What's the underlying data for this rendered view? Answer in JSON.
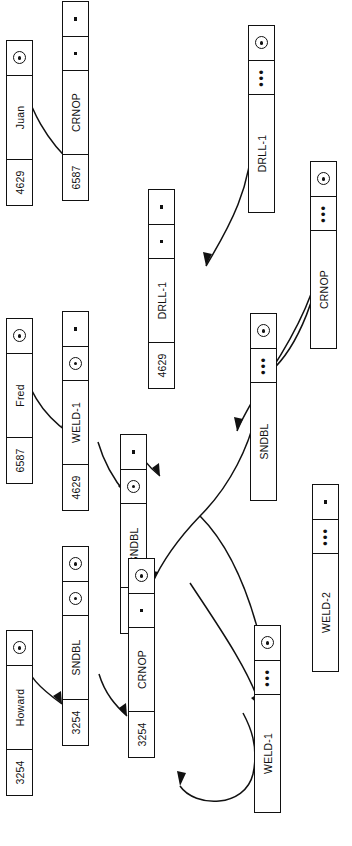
{
  "diagram": {
    "type": "linked-record-pointer-diagram",
    "orientation": "rotated-90-ccw",
    "colors": {
      "stroke": "#111111",
      "background": "#ffffff"
    },
    "glyphs": {
      "pointer": "pointer-dot",
      "dot": "small-square-dot",
      "ellipsis": "•••"
    }
  },
  "nodes": {
    "employee_juan": {
      "key": "4629",
      "name": "Juan",
      "ptr": "pointer-dot"
    },
    "employee_fred": {
      "key": "6587",
      "name": "Fred",
      "ptr": "pointer-dot"
    },
    "employee_howard": {
      "key": "3254",
      "name": "Howard",
      "ptr": "pointer-dot"
    },
    "skill_crnop_6587": {
      "key": "6587",
      "name": "CRNOP",
      "ptr": "dot",
      "ptr2": "dot"
    },
    "skill_weld1_4629": {
      "key": "4629",
      "name": "WELD-1",
      "ptr": "pointer-dot",
      "ptr2": "dot"
    },
    "skill_sndbl_4629": {
      "key": "4629",
      "name": "SNDBL",
      "ptr": "pointer-dot",
      "ptr2": "dot"
    },
    "skill_drll1_4629": {
      "key": "4629",
      "name": "DRLL-1",
      "ptr": "dot",
      "ptr2": "dot"
    },
    "skill_sndbl_3254": {
      "key": "3254",
      "name": "SNDBL",
      "ptr": "pointer-dot",
      "ptr2": "pointer-dot"
    },
    "skill_crnop_3254": {
      "key": "3254",
      "name": "CRNOP",
      "ptr": "dot",
      "ptr2": "pointer-dot"
    },
    "type_drll1": {
      "name": "DRLL-1",
      "dots": "•••",
      "ptr": "pointer-dot"
    },
    "type_crnop": {
      "name": "CRNOP",
      "dots": "•••",
      "ptr": "pointer-dot"
    },
    "type_sndbl": {
      "name": "SNDBL",
      "dots": "•••",
      "ptr": "pointer-dot"
    },
    "type_weld1": {
      "name": "WELD-1",
      "dots": "•••",
      "ptr": "pointer-dot"
    },
    "type_weld2": {
      "name": "WELD-2",
      "dots": "•••",
      "ptr": "dot"
    }
  },
  "links": [
    {
      "from": "employee_juan",
      "to": "skill_crnop_6587"
    },
    {
      "from": "employee_fred",
      "to": "skill_weld1_4629"
    },
    {
      "from": "employee_howard",
      "to": "skill_sndbl_3254"
    },
    {
      "from": "skill_weld1_4629",
      "to": "skill_sndbl_4629"
    },
    {
      "from": "skill_sndbl_4629",
      "to": "skill_drll1_4629"
    },
    {
      "from": "skill_sndbl_3254",
      "to": "skill_crnop_3254"
    },
    {
      "from": "type_drll1",
      "to": "skill_drll1_4629"
    },
    {
      "from": "type_crnop",
      "to": "skill_crnop_6587"
    },
    {
      "from": "type_sndbl",
      "to": "skill_sndbl_4629"
    },
    {
      "from": "type_weld1",
      "to": "skill_crnop_3254"
    },
    {
      "from": "skill_crnop_3254",
      "to": "skill_sndbl_3254"
    }
  ]
}
